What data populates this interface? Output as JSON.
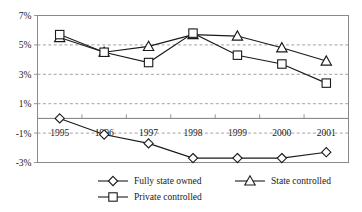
{
  "chart_data": {
    "type": "line",
    "title": "",
    "subtitle": "",
    "xlabel": "",
    "ylabel": "",
    "categories": [
      "1995",
      "1996",
      "1997",
      "1998",
      "1999",
      "2000",
      "2001"
    ],
    "x": [
      1995,
      1996,
      1997,
      1998,
      1999,
      2000,
      2001
    ],
    "ylim": [
      -3,
      7
    ],
    "y_ticks": [
      "7%",
      "5%",
      "3%",
      "1%",
      "-1%",
      "-3%"
    ],
    "y_tick_values": [
      7,
      5,
      3,
      1,
      -1,
      -3
    ],
    "grid": "horizontal-dashed",
    "legend_position": "bottom",
    "series": [
      {
        "name": "Fully state owned",
        "marker": "diamond",
        "values": [
          0.0,
          -1.1,
          -1.7,
          -2.7,
          -2.7,
          -2.7,
          -2.3
        ]
      },
      {
        "name": "State controlled",
        "marker": "triangle",
        "values": [
          5.5,
          4.5,
          4.9,
          5.7,
          5.6,
          4.8,
          3.9
        ]
      },
      {
        "name": "Private controlled",
        "marker": "square",
        "values": [
          5.7,
          4.5,
          3.8,
          5.8,
          4.3,
          3.7,
          2.4
        ]
      }
    ],
    "colors": {
      "line": "#1a1a1a",
      "marker_fill": "#ffffff",
      "grid": "#8c8c8c",
      "frame": "#8a8a8a",
      "background": "#ffffff"
    }
  },
  "axis": {
    "y_labels": [
      "7%",
      "5%",
      "3%",
      "1%",
      "-1%",
      "-3%"
    ],
    "x_labels": [
      "1995",
      "1996",
      "1997",
      "1998",
      "1999",
      "2000",
      "2001"
    ]
  },
  "legend": {
    "items": [
      {
        "label": "Fully state owned",
        "marker": "diamond-marker"
      },
      {
        "label": "State controlled",
        "marker": "triangle-marker"
      },
      {
        "label": "Private controlled",
        "marker": "square-marker"
      }
    ]
  }
}
